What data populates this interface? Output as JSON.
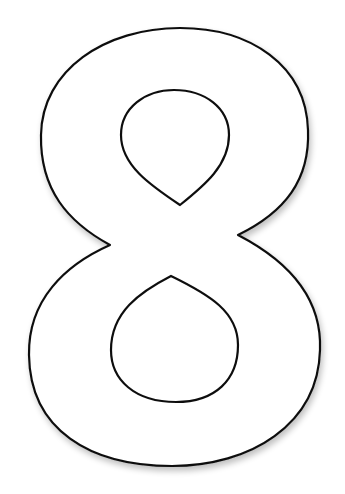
{
  "image": {
    "subject": "Outlined numeral eight",
    "glyph": "8",
    "fill_color": "#ffffff",
    "stroke_color": "#111111",
    "background_color": "#ffffff",
    "shadow_color": "#cfcfcf"
  }
}
